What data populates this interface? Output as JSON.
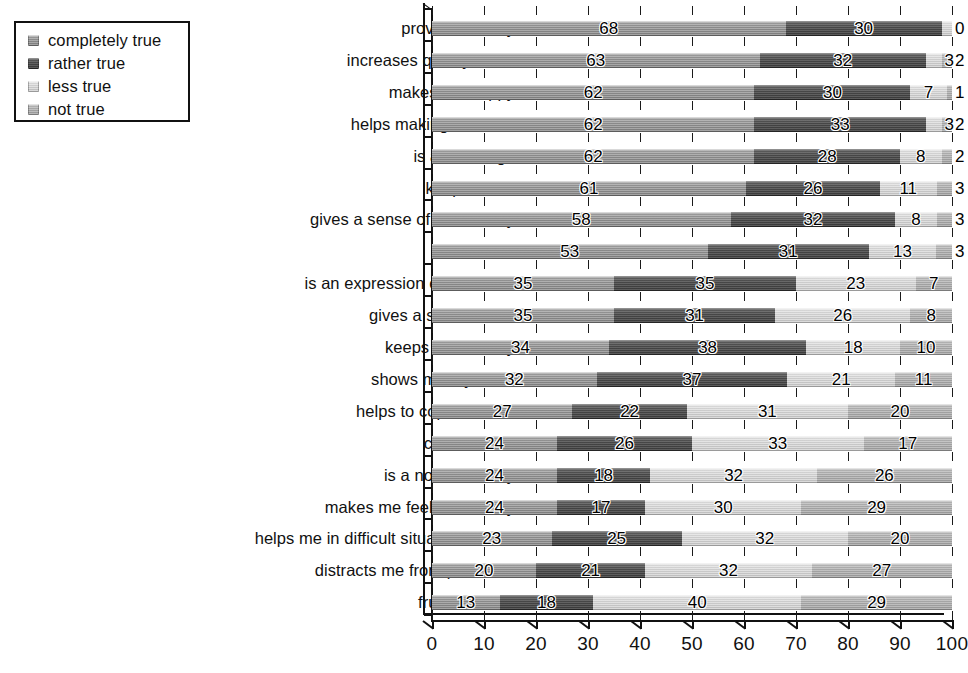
{
  "legend": {
    "items": [
      {
        "label": "completely true",
        "color": "#8a8a8a"
      },
      {
        "label": "rather true",
        "color": "#454545"
      },
      {
        "label": "less true",
        "color": "#cbcbcb"
      },
      {
        "label": "not true",
        "color": "#a4a4a4"
      }
    ]
  },
  "axis": {
    "x_ticks": [
      "0",
      "10",
      "20",
      "30",
      "40",
      "50",
      "60",
      "70",
      "80",
      "90",
      "100"
    ]
  },
  "chart_data": {
    "type": "bar",
    "orientation": "horizontal",
    "stacked": true,
    "stack_mode": "percent",
    "title": "",
    "subtitle": "",
    "xlabel": "",
    "ylabel": "",
    "xlim": [
      0,
      100
    ],
    "xticks": [
      0,
      10,
      20,
      30,
      40,
      50,
      60,
      70,
      80,
      90,
      100
    ],
    "grid": true,
    "legend_position": "top-left",
    "categories": [
      "provides vitality",
      "increases quality of life",
      "makes me happy",
      "helps making contacts",
      "is a challenge",
      "keeps me fit",
      "gives a sense of community",
      "relaxes me",
      "is an expression of emotions",
      "gives a sense to life",
      "keeps me healthy",
      "shows me my limits",
      "helps to cope with life",
      "comforts me",
      "is a normal hobby",
      "makes me feel less lonely",
      "helps me in difficult situations of life",
      "distracts me from problems",
      "frustrates me"
    ],
    "series": [
      {
        "name": "completely true",
        "values": [
          68,
          63,
          62,
          62,
          62,
          61,
          58,
          53,
          35,
          35,
          34,
          32,
          27,
          24,
          24,
          24,
          23,
          20,
          13
        ]
      },
      {
        "name": "rather true",
        "values": [
          30,
          32,
          30,
          33,
          28,
          26,
          32,
          31,
          35,
          31,
          38,
          37,
          22,
          26,
          18,
          17,
          25,
          21,
          18
        ]
      },
      {
        "name": "less true",
        "values": [
          2,
          3,
          7,
          3,
          8,
          11,
          8,
          13,
          23,
          26,
          18,
          21,
          31,
          33,
          32,
          30,
          32,
          32,
          40
        ]
      },
      {
        "name": "not true",
        "values": [
          0,
          2,
          1,
          2,
          2,
          3,
          3,
          3,
          7,
          8,
          10,
          11,
          20,
          17,
          26,
          29,
          20,
          27,
          29
        ]
      }
    ],
    "labels": [
      [
        "68",
        "30",
        "",
        "0"
      ],
      [
        "63",
        "32",
        "3",
        "2"
      ],
      [
        "62",
        "30",
        "7",
        "1"
      ],
      [
        "62",
        "33",
        "3",
        "2"
      ],
      [
        "62",
        "28",
        "8",
        "2"
      ],
      [
        "61",
        "26",
        "11",
        "3"
      ],
      [
        "58",
        "32",
        "8",
        "3"
      ],
      [
        "53",
        "31",
        "13",
        "3"
      ],
      [
        "35",
        "35",
        "23",
        "7"
      ],
      [
        "35",
        "31",
        "26",
        "8"
      ],
      [
        "34",
        "38",
        "18",
        "10"
      ],
      [
        "32",
        "37",
        "21",
        "11"
      ],
      [
        "27",
        "22",
        "31",
        "20"
      ],
      [
        "24",
        "26",
        "33",
        "17"
      ],
      [
        "24",
        "18",
        "32",
        "26"
      ],
      [
        "24",
        "17",
        "30",
        "29"
      ],
      [
        "23",
        "25",
        "32",
        "20"
      ],
      [
        "20",
        "21",
        "32",
        "27"
      ],
      [
        "13",
        "18",
        "40",
        "29"
      ]
    ]
  }
}
